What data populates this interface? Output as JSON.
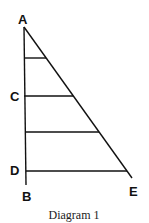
{
  "diagram": {
    "caption": "Diagram 1",
    "points": {
      "A": {
        "label": "A",
        "x": 24,
        "y": 27
      },
      "B": {
        "label": "B",
        "x": 26,
        "y": 185
      },
      "C": {
        "label": "C",
        "x": 24,
        "y": 96
      },
      "D": {
        "label": "D",
        "x": 26,
        "y": 171
      },
      "E": {
        "label": "E",
        "x": 132,
        "y": 178
      }
    },
    "label_positions": {
      "A": {
        "x": 18,
        "y": 24
      },
      "C": {
        "x": 10,
        "y": 101
      },
      "D": {
        "x": 10,
        "y": 175
      },
      "B": {
        "x": 22,
        "y": 201
      },
      "E": {
        "x": 129,
        "y": 196
      }
    },
    "vertical_side": {
      "from": "A",
      "to": "B"
    },
    "hypotenuse": {
      "from": "A",
      "to": "E"
    },
    "horizontal_segments": [
      {
        "y": 58,
        "x1": 24,
        "x2": 46
      },
      {
        "y": 96,
        "x1": 24,
        "x2": 73,
        "left_label": "C"
      },
      {
        "y": 132,
        "x1": 25,
        "x2": 99
      },
      {
        "y": 171,
        "x1": 26,
        "x2": 127,
        "left_label": "D"
      }
    ],
    "stroke_color": "#111111",
    "background_color": "#ffffff"
  }
}
